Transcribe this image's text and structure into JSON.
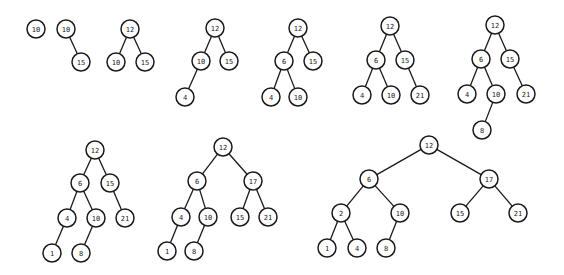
{
  "diagram": {
    "node_radius": 9,
    "colors": {
      "stroke": "#1a1a1a",
      "fill": "#ffffff",
      "background": "#ffffff"
    },
    "trees": [
      {
        "id": "step-1",
        "nodes": [
          {
            "id": "a",
            "label": "10",
            "x": 36,
            "y": 29
          }
        ],
        "edges": []
      },
      {
        "id": "step-2",
        "nodes": [
          {
            "id": "a",
            "label": "10",
            "x": 66,
            "y": 29
          },
          {
            "id": "b",
            "label": "15",
            "x": 81,
            "y": 62
          }
        ],
        "edges": [
          [
            "a",
            "b"
          ]
        ]
      },
      {
        "id": "step-3",
        "nodes": [
          {
            "id": "a",
            "label": "12",
            "x": 130,
            "y": 29
          },
          {
            "id": "b",
            "label": "10",
            "x": 116,
            "y": 62
          },
          {
            "id": "c",
            "label": "15",
            "x": 145,
            "y": 62
          }
        ],
        "edges": [
          [
            "a",
            "b"
          ],
          [
            "a",
            "c"
          ]
        ]
      },
      {
        "id": "step-4",
        "nodes": [
          {
            "id": "a",
            "label": "12",
            "x": 215,
            "y": 28
          },
          {
            "id": "b",
            "label": "10",
            "x": 201,
            "y": 61
          },
          {
            "id": "c",
            "label": "15",
            "x": 229,
            "y": 61
          },
          {
            "id": "d",
            "label": "4",
            "x": 185,
            "y": 97
          }
        ],
        "edges": [
          [
            "a",
            "b"
          ],
          [
            "a",
            "c"
          ],
          [
            "b",
            "d"
          ]
        ]
      },
      {
        "id": "step-5",
        "nodes": [
          {
            "id": "a",
            "label": "12",
            "x": 298,
            "y": 28
          },
          {
            "id": "b",
            "label": "6",
            "x": 284,
            "y": 61
          },
          {
            "id": "c",
            "label": "15",
            "x": 313,
            "y": 61
          },
          {
            "id": "d",
            "label": "4",
            "x": 271,
            "y": 97
          },
          {
            "id": "e",
            "label": "10",
            "x": 298,
            "y": 97
          }
        ],
        "edges": [
          [
            "a",
            "b"
          ],
          [
            "a",
            "c"
          ],
          [
            "b",
            "d"
          ],
          [
            "b",
            "e"
          ]
        ]
      },
      {
        "id": "step-6",
        "nodes": [
          {
            "id": "a",
            "label": "12",
            "x": 390,
            "y": 26
          },
          {
            "id": "b",
            "label": "6",
            "x": 376,
            "y": 60
          },
          {
            "id": "c",
            "label": "15",
            "x": 405,
            "y": 60
          },
          {
            "id": "d",
            "label": "4",
            "x": 362,
            "y": 95
          },
          {
            "id": "e",
            "label": "10",
            "x": 391,
            "y": 95
          },
          {
            "id": "f",
            "label": "21",
            "x": 420,
            "y": 95
          }
        ],
        "edges": [
          [
            "a",
            "b"
          ],
          [
            "a",
            "c"
          ],
          [
            "b",
            "d"
          ],
          [
            "b",
            "e"
          ],
          [
            "c",
            "f"
          ]
        ]
      },
      {
        "id": "step-7",
        "nodes": [
          {
            "id": "a",
            "label": "12",
            "x": 495,
            "y": 25
          },
          {
            "id": "b",
            "label": "6",
            "x": 481,
            "y": 59
          },
          {
            "id": "c",
            "label": "15",
            "x": 510,
            "y": 59
          },
          {
            "id": "d",
            "label": "4",
            "x": 467,
            "y": 94
          },
          {
            "id": "e",
            "label": "10",
            "x": 496,
            "y": 94
          },
          {
            "id": "f",
            "label": "21",
            "x": 526,
            "y": 94
          },
          {
            "id": "g",
            "label": "8",
            "x": 482,
            "y": 130
          }
        ],
        "edges": [
          [
            "a",
            "b"
          ],
          [
            "a",
            "c"
          ],
          [
            "b",
            "d"
          ],
          [
            "b",
            "e"
          ],
          [
            "c",
            "f"
          ],
          [
            "e",
            "g"
          ]
        ]
      },
      {
        "id": "step-8",
        "nodes": [
          {
            "id": "a",
            "label": "12",
            "x": 95,
            "y": 150
          },
          {
            "id": "b",
            "label": "6",
            "x": 80,
            "y": 183
          },
          {
            "id": "c",
            "label": "15",
            "x": 110,
            "y": 183
          },
          {
            "id": "d",
            "label": "4",
            "x": 67,
            "y": 218
          },
          {
            "id": "e",
            "label": "10",
            "x": 96,
            "y": 218
          },
          {
            "id": "f",
            "label": "21",
            "x": 125,
            "y": 218
          },
          {
            "id": "g",
            "label": "1",
            "x": 52,
            "y": 253
          },
          {
            "id": "h",
            "label": "8",
            "x": 81,
            "y": 253
          }
        ],
        "edges": [
          [
            "a",
            "b"
          ],
          [
            "a",
            "c"
          ],
          [
            "b",
            "d"
          ],
          [
            "b",
            "e"
          ],
          [
            "c",
            "f"
          ],
          [
            "d",
            "g"
          ],
          [
            "e",
            "h"
          ]
        ]
      },
      {
        "id": "step-9",
        "nodes": [
          {
            "id": "a",
            "label": "12",
            "x": 223,
            "y": 147
          },
          {
            "id": "b",
            "label": "6",
            "x": 197,
            "y": 181
          },
          {
            "id": "c",
            "label": "17",
            "x": 253,
            "y": 181
          },
          {
            "id": "d",
            "label": "4",
            "x": 181,
            "y": 217
          },
          {
            "id": "e",
            "label": "10",
            "x": 208,
            "y": 217
          },
          {
            "id": "f",
            "label": "15",
            "x": 240,
            "y": 217
          },
          {
            "id": "g",
            "label": "21",
            "x": 268,
            "y": 217
          },
          {
            "id": "h",
            "label": "1",
            "x": 167,
            "y": 251
          },
          {
            "id": "i",
            "label": "8",
            "x": 194,
            "y": 251
          }
        ],
        "edges": [
          [
            "a",
            "b"
          ],
          [
            "a",
            "c"
          ],
          [
            "b",
            "d"
          ],
          [
            "b",
            "e"
          ],
          [
            "c",
            "f"
          ],
          [
            "c",
            "g"
          ],
          [
            "d",
            "h"
          ],
          [
            "e",
            "i"
          ]
        ]
      },
      {
        "id": "step-10",
        "nodes": [
          {
            "id": "a",
            "label": "12",
            "x": 429,
            "y": 145
          },
          {
            "id": "b",
            "label": "6",
            "x": 369,
            "y": 179
          },
          {
            "id": "c",
            "label": "17",
            "x": 489,
            "y": 179
          },
          {
            "id": "d",
            "label": "2",
            "x": 341,
            "y": 213
          },
          {
            "id": "e",
            "label": "10",
            "x": 400,
            "y": 213
          },
          {
            "id": "f",
            "label": "15",
            "x": 460,
            "y": 213
          },
          {
            "id": "g",
            "label": "21",
            "x": 518,
            "y": 213
          },
          {
            "id": "h",
            "label": "1",
            "x": 327,
            "y": 248
          },
          {
            "id": "i",
            "label": "4",
            "x": 357,
            "y": 248
          },
          {
            "id": "j",
            "label": "8",
            "x": 386,
            "y": 248
          }
        ],
        "edges": [
          [
            "a",
            "b"
          ],
          [
            "a",
            "c"
          ],
          [
            "b",
            "d"
          ],
          [
            "b",
            "e"
          ],
          [
            "c",
            "f"
          ],
          [
            "c",
            "g"
          ],
          [
            "d",
            "h"
          ],
          [
            "d",
            "i"
          ],
          [
            "e",
            "j"
          ]
        ]
      }
    ]
  }
}
